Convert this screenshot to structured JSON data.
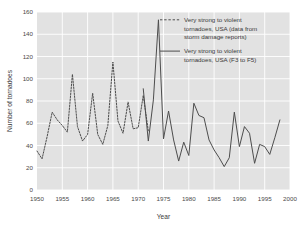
{
  "chart_data": {
    "type": "line",
    "title": "",
    "xlabel": "Year",
    "ylabel": "Number of tornadoes",
    "xlim": [
      1950,
      2000
    ],
    "ylim": [
      0,
      160
    ],
    "xticks": [
      1950,
      1955,
      1960,
      1965,
      1970,
      1975,
      1980,
      1985,
      1990,
      1995,
      2000
    ],
    "yticks": [
      0,
      20,
      40,
      60,
      80,
      100,
      120,
      140,
      160
    ],
    "grid": true,
    "grid_color": "#ffffff",
    "plot_bg": "#e2e2e2",
    "legend_position": "top-right",
    "series": [
      {
        "name": "Very strong to violent tornadoes, USA (data from storm damage reports)",
        "style": "dashed",
        "color": "#4d4d4d",
        "x": [
          1950,
          1951,
          1952,
          1953,
          1954,
          1955,
          1956,
          1957,
          1958,
          1959,
          1960,
          1961,
          1962,
          1963,
          1964,
          1965,
          1966,
          1967,
          1968,
          1969,
          1970,
          1971,
          1972
        ],
        "values": [
          35,
          28,
          48,
          70,
          63,
          58,
          52,
          104,
          57,
          44,
          50,
          87,
          50,
          41,
          58,
          115,
          62,
          51,
          79,
          55,
          56,
          85,
          53
        ]
      },
      {
        "name": "Very strong to violent tornadoes, USA (F3 to F5)",
        "style": "solid",
        "color": "#4d4d4d",
        "x": [
          1971,
          1972,
          1973,
          1974,
          1975,
          1976,
          1977,
          1978,
          1979,
          1980,
          1981,
          1982,
          1983,
          1984,
          1985,
          1986,
          1987,
          1988,
          1989,
          1990,
          1991,
          1992,
          1993,
          1994,
          1995,
          1996,
          1997,
          1998
        ],
        "values": [
          91,
          44,
          81,
          153,
          46,
          71,
          45,
          26,
          43,
          31,
          78,
          67,
          65,
          45,
          36,
          29,
          21,
          29,
          70,
          39,
          57,
          51,
          24,
          41,
          39,
          32,
          47,
          63
        ]
      }
    ]
  },
  "axes": {
    "x_title": "Year",
    "y_title": "Number of tornadoes",
    "x_tick_labels": [
      "1950",
      "1955",
      "1960",
      "1965",
      "1970",
      "1975",
      "1980",
      "1985",
      "1990",
      "1995",
      "2000"
    ],
    "y_tick_labels": [
      "0",
      "20",
      "40",
      "60",
      "80",
      "100",
      "120",
      "140",
      "160"
    ]
  },
  "legend": {
    "entries": [
      {
        "style": "dashed",
        "lines": [
          "Very strong to violent",
          "tornadoes, USA (data from",
          "storm damage reports)"
        ]
      },
      {
        "style": "solid",
        "lines": [
          "Very strong to violent",
          "tornadoes, USA (F3 to F5)"
        ]
      }
    ]
  }
}
